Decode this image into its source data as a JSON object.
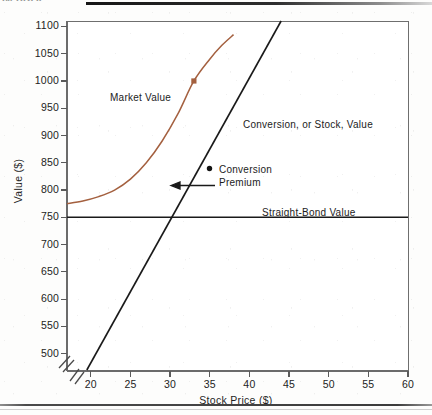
{
  "page": {
    "running_head": "IN PROF.",
    "background_color": "#fdfdfc"
  },
  "chart_data": {
    "type": "line",
    "title": "",
    "xlabel": "Stock Price ($)",
    "ylabel": "Value ($)",
    "xlim": [
      17,
      60
    ],
    "ylim": [
      470,
      1110
    ],
    "xticks": [
      20,
      25,
      30,
      35,
      40,
      45,
      50,
      55,
      60
    ],
    "yticks": [
      500,
      550,
      600,
      650,
      700,
      750,
      800,
      850,
      900,
      950,
      1000,
      1050,
      1100
    ],
    "grid": false,
    "legend_position": "inline-annotations",
    "y_axis_break": true,
    "y_axis_break_note": "axis broken between 0 and 500",
    "series": [
      {
        "name": "Market Value",
        "color": "#a4603f",
        "style": "curve",
        "points": [
          [
            17.0,
            775
          ],
          [
            19.0,
            780
          ],
          [
            21.0,
            788
          ],
          [
            23.0,
            800
          ],
          [
            25.0,
            820
          ],
          [
            27.0,
            850
          ],
          [
            29.0,
            890
          ],
          [
            31.0,
            940
          ],
          [
            33.0,
            1000
          ],
          [
            35.0,
            1040
          ],
          [
            36.5,
            1065
          ],
          [
            38.0,
            1085
          ]
        ],
        "marker": {
          "x": 33,
          "y": 1000,
          "shape": "square"
        }
      },
      {
        "name": "Conversion, or Stock, Value",
        "color": "#1a1a1a",
        "style": "straight-line",
        "points": [
          [
            19.5,
            470
          ],
          [
            44.0,
            1110
          ]
        ]
      },
      {
        "name": "Straight-Bond Value",
        "color": "#1a1a1a",
        "style": "horizontal-line",
        "points": [
          [
            17.0,
            750
          ],
          [
            60.0,
            750
          ]
        ]
      }
    ],
    "annotations": [
      {
        "id": "market-value",
        "text": "Market Value",
        "x": 22.8,
        "y": 955
      },
      {
        "id": "conversion-stock-value",
        "text": "Conversion, or Stock, Value",
        "x": 39.0,
        "y": 905
      },
      {
        "id": "conversion-premium",
        "text": "Conversion\nPremium",
        "x": 36.5,
        "y": 825,
        "arrow": "left"
      },
      {
        "id": "straight-bond-value",
        "text": "Straight-Bond Value",
        "x": 41.5,
        "y": 740
      },
      {
        "id": "premium-dot",
        "text": "",
        "x": 33.0,
        "y": 835
      }
    ],
    "annotation_labels": {
      "market_value": "Market Value",
      "conversion_stock_value": "Conversion, or Stock, Value",
      "conversion_premium_line1": "Conversion",
      "conversion_premium_line2": "Premium",
      "straight_bond_value": "Straight-Bond Value"
    },
    "tick_labels_y": [
      "1100",
      "1050",
      "1000",
      "950",
      "900",
      "850",
      "800",
      "750",
      "700",
      "650",
      "600",
      "550",
      "500"
    ],
    "tick_labels_x": [
      "20",
      "25",
      "30",
      "35",
      "40",
      "45",
      "50",
      "55",
      "60"
    ]
  }
}
